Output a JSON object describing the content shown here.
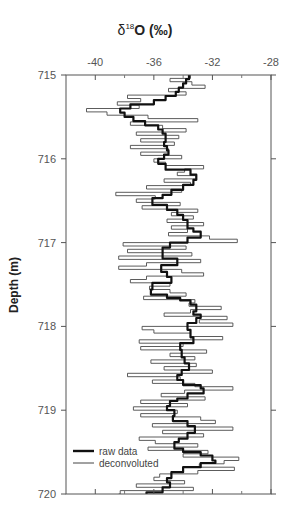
{
  "chart_data": {
    "type": "line",
    "title": "δ18O (‰)",
    "title_parts": {
      "symbol": "δ",
      "superscript": "18",
      "rest": "O (‰)"
    },
    "xlabel": "δ18O (‰)",
    "ylabel": "Depth (m)",
    "x_axis_position": "top",
    "y_axis_inverted": true,
    "xlim": [
      -42,
      -28
    ],
    "ylim": [
      715,
      720
    ],
    "x_ticks": [
      -40,
      -36,
      -32,
      -28
    ],
    "x_minor_ticks": [
      -38,
      -34,
      -30
    ],
    "y_ticks": [
      715,
      716,
      717,
      718,
      719,
      720
    ],
    "grid": false,
    "legend": {
      "position": "lower-left",
      "entries": [
        "raw data",
        "deconvoluted"
      ]
    },
    "series": [
      {
        "name": "raw data",
        "style": "thick step line",
        "color": "#111111",
        "depth": [
          715.0,
          715.05,
          715.1,
          715.15,
          715.2,
          715.25,
          715.3,
          715.35,
          715.4,
          715.45,
          715.5,
          715.55,
          715.6,
          715.65,
          715.7,
          715.75,
          715.8,
          715.85,
          715.9,
          715.95,
          716.0,
          716.06,
          716.13,
          716.19,
          716.25,
          716.31,
          716.37,
          716.43,
          716.47,
          716.55,
          716.61,
          716.67,
          716.73,
          716.83,
          716.87,
          716.94,
          717.0,
          717.06,
          717.15,
          717.19,
          717.27,
          717.35,
          717.41,
          717.48,
          717.56,
          717.62,
          717.66,
          717.69,
          717.74,
          717.82,
          717.86,
          717.9,
          717.96,
          718.04,
          718.13,
          718.2,
          718.28,
          718.37,
          718.44,
          718.52,
          718.58,
          718.64,
          718.7,
          718.74,
          718.8,
          718.86,
          718.89,
          718.95,
          719.0,
          719.07,
          719.13,
          719.19,
          719.27,
          719.34,
          719.38,
          719.46,
          719.5,
          719.54,
          719.6,
          719.63,
          719.68,
          719.74,
          719.81,
          719.86,
          719.92,
          719.98,
          720.0
        ],
        "d18O": [
          -33.6,
          -33.8,
          -34.0,
          -34.3,
          -34.5,
          -35.2,
          -36.0,
          -37.6,
          -38.3,
          -38.0,
          -37.4,
          -36.6,
          -35.7,
          -35.4,
          -35.2,
          -35.2,
          -35.3,
          -35.1,
          -35.0,
          -35.3,
          -35.7,
          -35.2,
          -33.5,
          -33.1,
          -33.3,
          -34.0,
          -34.8,
          -35.4,
          -36.1,
          -35.1,
          -34.4,
          -34.0,
          -33.7,
          -33.3,
          -32.8,
          -33.7,
          -34.9,
          -35.4,
          -35.4,
          -34.4,
          -35.5,
          -35.1,
          -34.8,
          -36.1,
          -36.2,
          -35.1,
          -34.2,
          -33.5,
          -33.1,
          -33.3,
          -32.8,
          -33.1,
          -33.7,
          -33.5,
          -33.3,
          -34.2,
          -34.1,
          -33.9,
          -33.6,
          -34.1,
          -34.4,
          -34.0,
          -32.8,
          -32.6,
          -33.7,
          -34.4,
          -34.9,
          -35.1,
          -34.6,
          -34.7,
          -33.7,
          -33.2,
          -33.7,
          -34.3,
          -34.6,
          -34.0,
          -32.8,
          -32.0,
          -31.8,
          -32.8,
          -34.0,
          -34.8,
          -35.1,
          -34.9,
          -35.4,
          -36.5,
          -36.5
        ]
      },
      {
        "name": "deconvoluted",
        "style": "thin step line",
        "color": "#444444",
        "depth": [
          715.0,
          715.04,
          715.08,
          715.12,
          715.16,
          715.2,
          715.24,
          715.28,
          715.32,
          715.36,
          715.4,
          715.44,
          715.48,
          715.52,
          715.56,
          715.6,
          715.64,
          715.68,
          715.72,
          715.76,
          715.8,
          715.84,
          715.88,
          715.92,
          715.96,
          716.0,
          716.04,
          716.08,
          716.12,
          716.16,
          716.2,
          716.24,
          716.28,
          716.32,
          716.36,
          716.4,
          716.44,
          716.48,
          716.52,
          716.56,
          716.6,
          716.64,
          716.68,
          716.72,
          716.76,
          716.8,
          716.84,
          716.88,
          716.92,
          716.96,
          717.0,
          717.04,
          717.08,
          717.12,
          717.16,
          717.2,
          717.24,
          717.28,
          717.32,
          717.36,
          717.4,
          717.44,
          717.48,
          717.52,
          717.56,
          717.6,
          717.64,
          717.68,
          717.72,
          717.76,
          717.8,
          717.84,
          717.88,
          717.92,
          717.96,
          718.0,
          718.04,
          718.08,
          718.12,
          718.16,
          718.2,
          718.24,
          718.28,
          718.32,
          718.36,
          718.4,
          718.44,
          718.48,
          718.52,
          718.56,
          718.6,
          718.64,
          718.68,
          718.72,
          718.76,
          718.8,
          718.84,
          718.88,
          718.92,
          718.96,
          719.0,
          719.04,
          719.08,
          719.12,
          719.16,
          719.2,
          719.24,
          719.28,
          719.32,
          719.36,
          719.4,
          719.44,
          719.48,
          719.52,
          719.56,
          719.6,
          719.64,
          719.68,
          719.72,
          719.76,
          719.8,
          719.84,
          719.88,
          719.92,
          719.96,
          720.0
        ],
        "d18O": [
          -33.5,
          -34.9,
          -33.4,
          -32.5,
          -35.0,
          -33.8,
          -37.8,
          -36.9,
          -38.5,
          -37.0,
          -40.6,
          -39.2,
          -36.4,
          -33.0,
          -37.6,
          -35.4,
          -33.8,
          -37.2,
          -34.3,
          -36.9,
          -34.6,
          -37.6,
          -35.0,
          -36.9,
          -34.1,
          -36.0,
          -35.2,
          -32.6,
          -33.9,
          -34.4,
          -33.1,
          -35.3,
          -33.5,
          -36.5,
          -34.1,
          -38.6,
          -35.9,
          -37.2,
          -34.2,
          -36.8,
          -33.0,
          -34.8,
          -33.3,
          -35.1,
          -32.6,
          -34.8,
          -33.7,
          -35.0,
          -32.2,
          -30.3,
          -38.1,
          -33.8,
          -37.8,
          -33.4,
          -38.4,
          -32.8,
          -36.5,
          -38.4,
          -34.1,
          -32.6,
          -36.5,
          -37.6,
          -34.9,
          -36.3,
          -34.9,
          -33.8,
          -36.7,
          -33.2,
          -33.6,
          -31.4,
          -33.5,
          -35.3,
          -31.0,
          -32.9,
          -30.6,
          -36.8,
          -36.0,
          -33.5,
          -31.3,
          -37.0,
          -34.0,
          -36.9,
          -32.4,
          -34.9,
          -33.2,
          -36.2,
          -33.1,
          -35.3,
          -32.0,
          -37.8,
          -34.2,
          -36.1,
          -33.2,
          -30.6,
          -33.9,
          -35.5,
          -32.5,
          -36.9,
          -33.7,
          -37.4,
          -34.4,
          -36.9,
          -32.8,
          -31.8,
          -36.1,
          -30.6,
          -35.4,
          -32.6,
          -37.0,
          -35.9,
          -33.0,
          -36.4,
          -32.3,
          -34.0,
          -30.2,
          -31.2,
          -32.9,
          -30.5,
          -33.0,
          -35.6,
          -36.0,
          -33.9,
          -37.2,
          -33.3,
          -38.3,
          -38.4
        ]
      }
    ]
  },
  "axes": {
    "x_tick_labels": [
      "-40",
      "-36",
      "-32",
      "-28"
    ],
    "y_tick_labels": [
      "715",
      "716",
      "717",
      "718",
      "719",
      "720"
    ],
    "ylabel": "Depth (m)"
  },
  "legend": {
    "raw_label": "raw data",
    "deconvoluted_label": "deconvoluted"
  },
  "colors": {
    "raw": "#111111",
    "deconvoluted": "#4a4a4a",
    "axis": "#555555"
  }
}
